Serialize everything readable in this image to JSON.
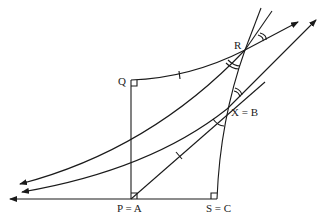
{
  "diagram": {
    "type": "hyperbolic-geometry-figure",
    "stroke_color": "#1a1a1a",
    "background": "#ffffff",
    "points": [
      {
        "id": "Q",
        "label": "Q",
        "x": 131,
        "y": 80
      },
      {
        "id": "R",
        "label": "R",
        "x": 245,
        "y": 50
      },
      {
        "id": "XB",
        "label": "X = B",
        "x": 227,
        "y": 109
      },
      {
        "id": "PA",
        "label": "P = A",
        "x": 131,
        "y": 199
      },
      {
        "id": "SC",
        "label": "S = C",
        "x": 217,
        "y": 199
      }
    ],
    "right_angle_marks": [
      "Q",
      "P = A",
      "S = C"
    ],
    "tick_marks": [
      "arc Q-R",
      "segment P-X"
    ],
    "angle_marks": [
      "at R (upper)",
      "at R (lower-left)",
      "at X (upper)",
      "at X (lower-left)"
    ]
  }
}
